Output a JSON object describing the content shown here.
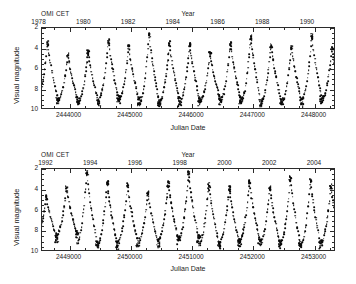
{
  "figure": {
    "object_name": "OMI CET",
    "y_axis_title": "Visual magnitude",
    "x_axis_title": "Julian Date",
    "top_axis_title": "Year"
  },
  "panels": [
    {
      "id": "top",
      "series_label": "OMI CET",
      "y_title": "Visual magnitude",
      "x_title": "Julian Date",
      "top_title": "Year",
      "x_ticks": [
        "2444000",
        "2445000",
        "2446000",
        "2447000",
        "2448000"
      ],
      "x_tick_values": [
        2444000,
        2445000,
        2446000,
        2447000,
        2448000
      ],
      "y_ticks": [
        "2",
        "4",
        "6",
        "8",
        "10"
      ],
      "y_tick_values": [
        2,
        4,
        6,
        8,
        10
      ],
      "year_ticks": [
        "1978",
        "1980",
        "1982",
        "1984",
        "1986",
        "1988",
        "1990"
      ],
      "year_tick_values": [
        1978,
        1980,
        1982,
        1984,
        1986,
        1988,
        1990
      ]
    },
    {
      "id": "bottom",
      "series_label": "OMI CET",
      "y_title": "Visual magnitude",
      "x_title": "Julian Date",
      "top_title": "Year",
      "x_ticks": [
        "2449000",
        "2450000",
        "2451000",
        "2452000",
        "2453000"
      ],
      "x_tick_values": [
        2449000,
        2450000,
        2451000,
        2452000,
        2453000
      ],
      "y_ticks": [
        "2",
        "4",
        "6",
        "8",
        "10"
      ],
      "y_tick_values": [
        2,
        4,
        6,
        8,
        10
      ],
      "year_ticks": [
        "1992",
        "1994",
        "1996",
        "1998",
        "2000",
        "2002",
        "2004"
      ],
      "year_tick_values": [
        1992,
        1994,
        1996,
        1998,
        2000,
        2002,
        2004
      ]
    }
  ],
  "chart_data": [
    {
      "type": "scatter",
      "panel": "top",
      "title": "OMI CET",
      "xlabel": "Julian Date",
      "ylabel": "Visual magnitude",
      "top_axis_label": "Year",
      "xlim": [
        2443550,
        2448350
      ],
      "ylim": [
        10,
        2
      ],
      "y_inverted": true,
      "grid": false,
      "legend": "none",
      "marker": "filled-circle",
      "marker_color": "#0a0a0a",
      "xtick_labels": [
        "2444000",
        "2445000",
        "2446000",
        "2447000",
        "2448000"
      ],
      "xticks": [
        2444000,
        2445000,
        2446000,
        2447000,
        2448000
      ],
      "ytick_labels": [
        "2",
        "4",
        "6",
        "8",
        "10"
      ],
      "yticks": [
        2,
        4,
        6,
        8,
        10
      ],
      "top_xtick_labels": [
        "1978",
        "1980",
        "1982",
        "1984",
        "1986",
        "1988",
        "1990"
      ],
      "top_xticks_jd": [
        2443510,
        2444241,
        2444971,
        2445701,
        2446432,
        2447162,
        2447893
      ],
      "period_days": 332,
      "cycles": [
        {
          "max_jd": 2443640,
          "max_mag": 3.4,
          "min_jd": 2443806,
          "min_mag": 9.0
        },
        {
          "max_jd": 2443972,
          "max_mag": 4.6,
          "min_jd": 2444138,
          "min_mag": 9.1
        },
        {
          "max_jd": 2444304,
          "max_mag": 4.3,
          "min_jd": 2444470,
          "min_mag": 9.2
        },
        {
          "max_jd": 2444636,
          "max_mag": 3.2,
          "min_jd": 2444802,
          "min_mag": 9.0
        },
        {
          "max_jd": 2444968,
          "max_mag": 3.8,
          "min_jd": 2445134,
          "min_mag": 9.1
        },
        {
          "max_jd": 2445300,
          "max_mag": 2.6,
          "min_jd": 2445466,
          "min_mag": 9.4
        },
        {
          "max_jd": 2445632,
          "max_mag": 3.4,
          "min_jd": 2445798,
          "min_mag": 9.2
        },
        {
          "max_jd": 2445964,
          "max_mag": 3.6,
          "min_jd": 2446130,
          "min_mag": 9.2
        },
        {
          "max_jd": 2446296,
          "max_mag": 4.5,
          "min_jd": 2446462,
          "min_mag": 9.1
        },
        {
          "max_jd": 2446628,
          "max_mag": 3.5,
          "min_jd": 2446794,
          "min_mag": 9.0
        },
        {
          "max_jd": 2446960,
          "max_mag": 2.8,
          "min_jd": 2447126,
          "min_mag": 9.3
        },
        {
          "max_jd": 2447292,
          "max_mag": 3.6,
          "min_jd": 2447458,
          "min_mag": 9.2
        },
        {
          "max_jd": 2447624,
          "max_mag": 3.7,
          "min_jd": 2447790,
          "min_mag": 9.3
        },
        {
          "max_jd": 2447956,
          "max_mag": 2.7,
          "min_jd": 2448122,
          "min_mag": 9.0
        },
        {
          "max_jd": 2448288,
          "max_mag": 3.9,
          "min_jd": 2448454,
          "min_mag": 9.0
        }
      ]
    },
    {
      "type": "scatter",
      "panel": "bottom",
      "title": "OMI CET",
      "xlabel": "Julian Date",
      "ylabel": "Visual magnitude",
      "top_axis_label": "Year",
      "xlim": [
        2448550,
        2453350
      ],
      "ylim": [
        10,
        2
      ],
      "y_inverted": true,
      "grid": false,
      "legend": "none",
      "marker": "filled-circle",
      "marker_color": "#0a0a0a",
      "xtick_labels": [
        "2449000",
        "2450000",
        "2451000",
        "2452000",
        "2453000"
      ],
      "xticks": [
        2449000,
        2450000,
        2451000,
        2452000,
        2453000
      ],
      "ytick_labels": [
        "2",
        "4",
        "6",
        "8",
        "10"
      ],
      "yticks": [
        2,
        4,
        6,
        8,
        10
      ],
      "top_xtick_labels": [
        "1992",
        "1994",
        "1996",
        "1998",
        "2000",
        "2002",
        "2004"
      ],
      "top_xticks_jd": [
        2448623,
        2449353,
        2450084,
        2450814,
        2451545,
        2452275,
        2453006
      ],
      "period_days": 332,
      "cycles": [
        {
          "max_jd": 2448620,
          "max_mag": 4.6,
          "min_jd": 2448786,
          "min_mag": 8.7
        },
        {
          "max_jd": 2448952,
          "max_mag": 3.8,
          "min_jd": 2449118,
          "min_mag": 8.3
        },
        {
          "max_jd": 2449284,
          "max_mag": 2.2,
          "min_jd": 2449450,
          "min_mag": 9.2
        },
        {
          "max_jd": 2449616,
          "max_mag": 3.3,
          "min_jd": 2449782,
          "min_mag": 9.4
        },
        {
          "max_jd": 2449948,
          "max_mag": 3.5,
          "min_jd": 2450114,
          "min_mag": 9.1
        },
        {
          "max_jd": 2450280,
          "max_mag": 4.3,
          "min_jd": 2450446,
          "min_mag": 9.2
        },
        {
          "max_jd": 2450612,
          "max_mag": 3.3,
          "min_jd": 2450778,
          "min_mag": 8.9
        },
        {
          "max_jd": 2450944,
          "max_mag": 2.4,
          "min_jd": 2451110,
          "min_mag": 8.8
        },
        {
          "max_jd": 2451276,
          "max_mag": 3.5,
          "min_jd": 2451442,
          "min_mag": 9.3
        },
        {
          "max_jd": 2451608,
          "max_mag": 3.8,
          "min_jd": 2451774,
          "min_mag": 9.1
        },
        {
          "max_jd": 2451940,
          "max_mag": 3.2,
          "min_jd": 2452106,
          "min_mag": 8.9
        },
        {
          "max_jd": 2452272,
          "max_mag": 3.7,
          "min_jd": 2452438,
          "min_mag": 9.3
        },
        {
          "max_jd": 2452604,
          "max_mag": 2.8,
          "min_jd": 2452770,
          "min_mag": 9.2
        },
        {
          "max_jd": 2452936,
          "max_mag": 3.1,
          "min_jd": 2453102,
          "min_mag": 9.3
        },
        {
          "max_jd": 2453268,
          "max_mag": 3.6,
          "min_jd": 2453434,
          "min_mag": 9.1
        }
      ]
    }
  ]
}
